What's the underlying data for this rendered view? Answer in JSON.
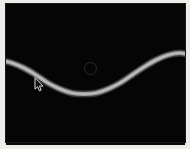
{
  "app": {
    "title": "Curve Canvas",
    "background_color": "#eeece8",
    "canvas_color": "#050505"
  },
  "canvas": {
    "name": "plot-canvas",
    "width": 179,
    "height": 138,
    "offset_x": 6,
    "offset_y": 4
  },
  "curve": {
    "label": "sine-curve",
    "color": "#9a9a9a",
    "highlight_color": "#c8c8c8",
    "stroke_width": 4.2
  },
  "marker": {
    "label": "control-point",
    "color": "#2b2b2b",
    "x": 89,
    "y": 67,
    "radius": 5.5
  },
  "cursor": {
    "label": "arrow-cursor",
    "color": "#d8d8d8",
    "x": 34,
    "y": 77
  },
  "chart_data": {
    "type": "line",
    "title": "",
    "xlabel": "",
    "ylabel": "",
    "xlim": [
      0,
      190
    ],
    "ylim": [
      0,
      149
    ],
    "grid": false,
    "legend": "none",
    "series": [
      {
        "name": "sine-curve",
        "color": "#9a9a9a",
        "x": [
          0,
          12,
          24,
          36,
          48,
          60,
          72,
          84,
          96,
          108,
          120,
          132,
          144,
          156,
          168,
          180,
          190
        ],
        "y": [
          60,
          63,
          68,
          75,
          83,
          89,
          93,
          94,
          93,
          89,
          83,
          75,
          67,
          60,
          55,
          53,
          55
        ]
      }
    ],
    "annotations": [
      {
        "type": "point-marker",
        "x": 95,
        "y": 73,
        "style": "open-circle",
        "color": "#2b2b2b"
      }
    ]
  }
}
